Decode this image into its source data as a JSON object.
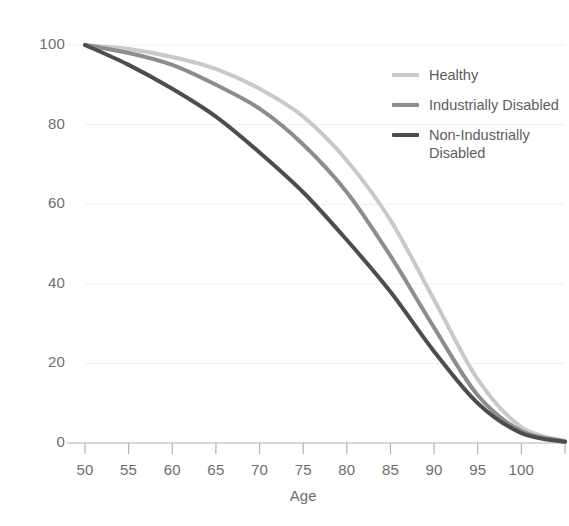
{
  "chart_data": {
    "type": "line",
    "title": "",
    "subtitle": "",
    "xlabel": "Age",
    "ylabel": "",
    "xlim": [
      50,
      105
    ],
    "ylim": [
      0,
      100
    ],
    "grid": "horizontal-faint",
    "legend_position": "top-right",
    "x_ticks": [
      50,
      55,
      60,
      65,
      70,
      75,
      80,
      85,
      90,
      95,
      100,
      105
    ],
    "x_tick_labels": [
      "50",
      "55",
      "60",
      "65",
      "70",
      "75",
      "80",
      "85",
      "90",
      "95",
      "100",
      ""
    ],
    "y_ticks": [
      0,
      20,
      40,
      60,
      80,
      100
    ],
    "y_tick_labels": [
      "0",
      "20",
      "40",
      "60",
      "80",
      "100"
    ],
    "x": [
      50,
      55,
      60,
      65,
      70,
      75,
      80,
      85,
      90,
      95,
      100,
      105
    ],
    "series": [
      {
        "name": "Healthy",
        "color": "#c9c9c9",
        "width": 4,
        "values": [
          100,
          99,
          97,
          94,
          89,
          82,
          71,
          56,
          36,
          16,
          4,
          0.5
        ]
      },
      {
        "name": "Industrially Disabled",
        "color": "#8d8d8d",
        "width": 4,
        "values": [
          100,
          98,
          95,
          90,
          84,
          75,
          63,
          47,
          29,
          12,
          3,
          0.4
        ]
      },
      {
        "name": "Non-Industrially Disabled",
        "color": "#4d4d4d",
        "width": 4,
        "values": [
          100,
          95,
          89,
          82,
          73,
          63,
          51,
          38,
          23,
          10,
          2.5,
          0.3
        ]
      }
    ],
    "annotations": []
  },
  "legend": {
    "items": [
      {
        "label": "Healthy",
        "color": "#c9c9c9"
      },
      {
        "label": "Industrially Disabled",
        "color": "#8d8d8d"
      },
      {
        "label": "Non-Industrially Disabled",
        "color": "#4d4d4d"
      }
    ]
  },
  "axes": {
    "x_title": "Age",
    "axis_color": "#b3b3b3",
    "tick_color": "#b3b3b3",
    "label_color": "#6e6e6e",
    "grid_color": "#f0f0f0"
  }
}
